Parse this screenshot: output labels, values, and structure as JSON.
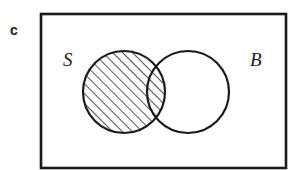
{
  "figure": {
    "panel_label": "c",
    "type": "venn-diagram",
    "background_color": "#ffffff",
    "stroke_color": "#1a1a1a",
    "hatch_color": "#1a1a1a"
  },
  "frame": {
    "name": "universal-set-box",
    "x": 41,
    "y": 14,
    "width": 245,
    "height": 154,
    "stroke_width": 2.6
  },
  "sets": [
    {
      "id": "S",
      "label": "S",
      "label_x": 63,
      "label_y": 66,
      "cx": 124,
      "cy": 92,
      "r": 41,
      "shaded": true,
      "stroke_width": 2.2
    },
    {
      "id": "B",
      "label": "B",
      "label_x": 250,
      "label_y": 66,
      "cx": 188,
      "cy": 92,
      "r": 41,
      "shaded": false,
      "stroke_width": 2.2
    }
  ],
  "shading": {
    "region": "S minus intersection of S and B",
    "pattern": "diagonal-hatch",
    "angle_degrees": 45,
    "direction": "lower-left to upper-right",
    "spacing_px": 7,
    "line_width_px": 1.5,
    "color": "#1a1a1a"
  },
  "chart_data": {
    "type": "venn",
    "title": "",
    "sets": [
      "S",
      "B"
    ],
    "shaded_regions": [
      "S only"
    ],
    "unshaded_regions": [
      "S and B",
      "B only",
      "outside"
    ],
    "legend": []
  }
}
